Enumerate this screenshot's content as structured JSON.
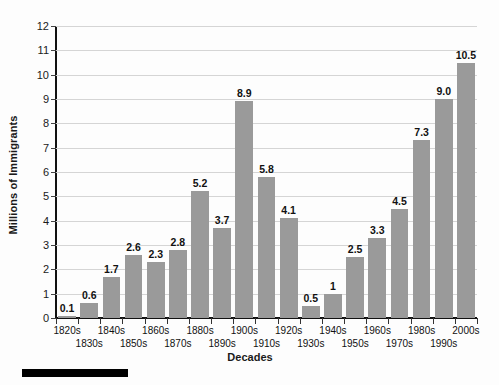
{
  "chart_data": {
    "type": "bar",
    "title": "",
    "xlabel": "Decades",
    "ylabel": "Millions of Immigrants",
    "ylim": [
      0,
      12
    ],
    "ytick_step": 1,
    "grid": true,
    "legend": "none",
    "bar_color": "#9a9a9a",
    "categories": [
      "1820s",
      "1830s",
      "1840s",
      "1850s",
      "1860s",
      "1870s",
      "1880s",
      "1890s",
      "1900s",
      "1910s",
      "1920s",
      "1930s",
      "1940s",
      "1950s",
      "1960s",
      "1970s",
      "1980s",
      "1990s",
      "2000s"
    ],
    "values": [
      0.1,
      0.6,
      1.7,
      2.6,
      2.3,
      2.8,
      5.2,
      3.7,
      8.9,
      5.8,
      4.1,
      0.5,
      1,
      2.5,
      3.3,
      4.5,
      7.3,
      9.0,
      10.5
    ],
    "value_labels": [
      "0.1",
      "0.6",
      "1.7",
      "2.6",
      "2.3",
      "2.8",
      "5.2",
      "3.7",
      "8.9",
      "5.8",
      "4.1",
      "0.5",
      "1",
      "2.5",
      "3.3",
      "4.5",
      "7.3",
      "9.0",
      "10.5"
    ],
    "ytick_labels": [
      "0",
      "1",
      "2",
      "3",
      "4",
      "5",
      "6",
      "7",
      "8",
      "9",
      "10",
      "11",
      "12"
    ]
  },
  "figure": {
    "scale_bar_present": true
  }
}
